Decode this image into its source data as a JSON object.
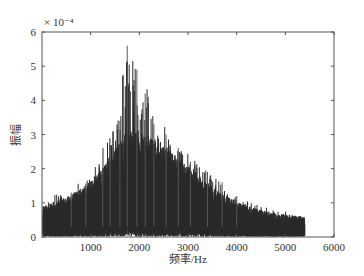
{
  "chart_data": {
    "type": "line",
    "title": "",
    "xlabel": "频率/Hz",
    "ylabel": "振幅",
    "y_exponent_label": "× 10⁻⁴",
    "xlim": [
      0,
      6000
    ],
    "ylim": [
      0,
      6
    ],
    "y_scale": 0.0001,
    "grid": false,
    "legend": null,
    "x_ticks": [
      1000,
      2000,
      3000,
      4000,
      5000,
      6000
    ],
    "x_tick_labels": [
      "1000",
      "2000",
      "3000",
      "4000",
      "5000",
      "6000"
    ],
    "y_ticks": [
      0,
      1,
      2,
      3,
      4,
      5,
      6
    ],
    "y_tick_labels": [
      "0",
      "1",
      "2",
      "3",
      "4",
      "5",
      "6"
    ],
    "series": [
      {
        "name": "amplitude spectrum",
        "color": "#2b2b2b",
        "description": "Dense noisy spectrum from ~0 to ~5400 Hz, envelope rising to a maximum near 1700-2200 Hz and decaying toward 5400 Hz",
        "envelope_x": [
          0,
          500,
          1000,
          1500,
          1750,
          2000,
          2500,
          3000,
          3500,
          4000,
          4500,
          5000,
          5400
        ],
        "envelope_upper": [
          1.1,
          1.4,
          1.8,
          3.4,
          5.6,
          4.9,
          3.5,
          2.5,
          1.8,
          1.2,
          0.9,
          0.75,
          0.6
        ],
        "envelope_typical": [
          0.7,
          0.9,
          1.2,
          2.0,
          2.4,
          2.4,
          2.1,
          1.6,
          1.1,
          0.8,
          0.6,
          0.5,
          0.45
        ],
        "peak": {
          "x": 1750,
          "y": 5.6
        }
      }
    ]
  }
}
